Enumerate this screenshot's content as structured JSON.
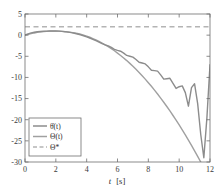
{
  "chart_data": {
    "type": "line",
    "title": "",
    "subtitle": "",
    "xlabel": "t  [s]",
    "ylabel": "",
    "xlim": [
      0,
      12
    ],
    "ylim": [
      -30,
      5
    ],
    "xticks": [
      0,
      2,
      4,
      6,
      8,
      10,
      12
    ],
    "xtick_labels": [
      "0",
      "2",
      "4",
      "6",
      "8",
      "10",
      "12"
    ],
    "yticks": [
      5,
      0,
      -5,
      -10,
      -15,
      -20,
      -25,
      -30
    ],
    "ytick_labels": [
      "5",
      "0",
      "-5",
      "-10",
      "-15",
      "-20",
      "-25",
      "-30"
    ],
    "grid": false,
    "box": true,
    "legend_position": "lower left",
    "series": [
      {
        "name": "theta-dot-t",
        "label": "θ̇(t)",
        "style": "solid",
        "color": "#8c8c8c",
        "width": 1.4,
        "x": [
          0,
          0.2,
          0.4,
          0.6,
          0.8,
          1.0,
          1.2,
          1.4,
          1.6,
          1.8,
          2.0,
          2.2,
          2.4,
          2.6,
          2.8,
          3.0,
          3.2,
          3.4,
          3.6,
          3.8,
          4.0,
          4.2,
          4.4,
          4.6,
          4.8,
          5.0,
          5.2,
          5.4,
          5.6,
          5.8,
          6.0,
          6.2,
          6.4,
          6.6,
          6.8,
          7.0,
          7.2,
          7.4,
          7.6,
          7.8,
          8.0,
          8.2,
          8.4,
          8.6,
          8.8,
          9.0,
          9.2,
          9.4,
          9.6,
          9.8,
          10.0,
          10.2,
          10.4,
          10.6,
          10.8,
          11.0,
          11.2,
          11.4,
          11.6,
          11.8,
          12.0
        ],
        "y": [
          0.05,
          0.3,
          0.52,
          0.68,
          0.8,
          0.88,
          0.93,
          0.96,
          0.98,
          0.99,
          0.98,
          0.95,
          0.9,
          0.82,
          0.72,
          0.6,
          0.45,
          0.28,
          0.08,
          -0.15,
          -0.4,
          -0.68,
          -0.98,
          -1.3,
          -1.65,
          -2.0,
          -2.3,
          -2.55,
          -2.9,
          -3.35,
          -3.6,
          -3.8,
          -4.25,
          -4.8,
          -5.0,
          -5.2,
          -5.75,
          -6.4,
          -6.6,
          -6.8,
          -7.5,
          -8.3,
          -8.4,
          -8.5,
          -9.4,
          -10.4,
          -10.3,
          -10.2,
          -11.4,
          -12.6,
          -12.2,
          -12.0,
          -13.6,
          -16.8,
          -12.4,
          -11.5,
          -16.2,
          -23.5,
          -29.0,
          -19.5,
          -7.0
        ]
      },
      {
        "name": "Theta-t",
        "label": "Θ(t)",
        "style": "solid",
        "color": "#a0a0a0",
        "width": 1.4,
        "x": [
          0,
          0.2,
          0.4,
          0.6,
          0.8,
          1.0,
          1.2,
          1.4,
          1.6,
          1.8,
          2.0,
          2.2,
          2.4,
          2.6,
          2.8,
          3.0,
          3.2,
          3.4,
          3.6,
          3.8,
          4.0,
          4.2,
          4.4,
          4.6,
          4.8,
          5.0,
          5.2,
          5.4,
          5.6,
          5.8,
          6.0,
          6.2,
          6.4,
          6.6,
          6.8,
          7.0,
          7.2,
          7.4,
          7.6,
          7.8,
          8.0,
          8.2,
          8.4,
          8.6,
          8.8,
          9.0,
          9.2,
          9.4,
          9.6,
          9.8,
          10.0,
          10.2,
          10.4,
          10.6,
          10.8,
          11.0,
          11.2,
          11.4,
          11.6,
          11.8,
          12.0
        ],
        "y": [
          0.0,
          0.18,
          0.36,
          0.52,
          0.65,
          0.76,
          0.84,
          0.9,
          0.94,
          0.96,
          0.96,
          0.94,
          0.9,
          0.84,
          0.76,
          0.66,
          0.53,
          0.38,
          0.2,
          0.0,
          -0.24,
          -0.5,
          -0.8,
          -1.12,
          -1.48,
          -1.86,
          -2.28,
          -2.72,
          -3.2,
          -3.7,
          -4.24,
          -4.8,
          -5.4,
          -6.02,
          -6.68,
          -7.36,
          -8.08,
          -8.82,
          -9.6,
          -10.4,
          -11.24,
          -12.1,
          -13.0,
          -13.92,
          -14.88,
          -15.86,
          -16.88,
          -17.92,
          -19.0,
          -20.1,
          -21.24,
          -22.4,
          -23.6,
          -24.82,
          -26.08,
          -27.36,
          -28.68,
          -30.0,
          -31.4,
          -32.8,
          -34.2
        ]
      },
      {
        "name": "Theta-star",
        "label": "Θ*",
        "style": "dashed",
        "color": "#b4b4b4",
        "width": 1.4,
        "constant": 2.0
      }
    ]
  },
  "legend": {
    "entries": [
      {
        "label": "θ̇(t)",
        "style": "solid",
        "color": "#8c8c8c"
      },
      {
        "label": "Θ(t)",
        "style": "solid",
        "color": "#a0a0a0"
      },
      {
        "label": "Θ*",
        "style": "dashed",
        "color": "#b4b4b4"
      }
    ]
  },
  "axes": {
    "xlabel": "t  [s]",
    "xlabel_italic_symbol": "t",
    "xlabel_unit": "[s]"
  }
}
